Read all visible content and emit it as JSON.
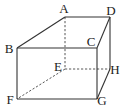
{
  "figure": {
    "type": "rectangular prism (cuboid) in oblique projection",
    "colors": {
      "background": "#ffffff",
      "line": "#333333"
    },
    "vertices": [
      {
        "id": "A",
        "label": "A",
        "x": 65,
        "y": 17,
        "lx": 64,
        "ly": 13
      },
      {
        "id": "B",
        "label": "B",
        "x": 17,
        "y": 48,
        "lx": 9,
        "ly": 53
      },
      {
        "id": "C",
        "label": "C",
        "x": 97,
        "y": 48,
        "lx": 91,
        "ly": 46
      },
      {
        "id": "D",
        "label": "D",
        "x": 110,
        "y": 17,
        "lx": 111,
        "ly": 15
      },
      {
        "id": "E",
        "label": "E",
        "x": 65,
        "y": 69,
        "lx": 58,
        "ly": 71
      },
      {
        "id": "F",
        "label": "F",
        "x": 17,
        "y": 99,
        "lx": 10,
        "ly": 104
      },
      {
        "id": "G",
        "label": "G",
        "x": 97,
        "y": 99,
        "lx": 102,
        "ly": 105
      },
      {
        "id": "H",
        "label": "H",
        "x": 110,
        "y": 69,
        "lx": 115,
        "ly": 74
      }
    ],
    "solid_edges": [
      [
        "B",
        "A"
      ],
      [
        "A",
        "D"
      ],
      [
        "D",
        "C"
      ],
      [
        "C",
        "B"
      ],
      [
        "B",
        "F"
      ],
      [
        "C",
        "G"
      ],
      [
        "F",
        "G"
      ],
      [
        "G",
        "H"
      ],
      [
        "D",
        "H"
      ]
    ],
    "hidden_edges": [
      [
        "A",
        "E"
      ],
      [
        "E",
        "F"
      ],
      [
        "E",
        "H"
      ]
    ]
  }
}
